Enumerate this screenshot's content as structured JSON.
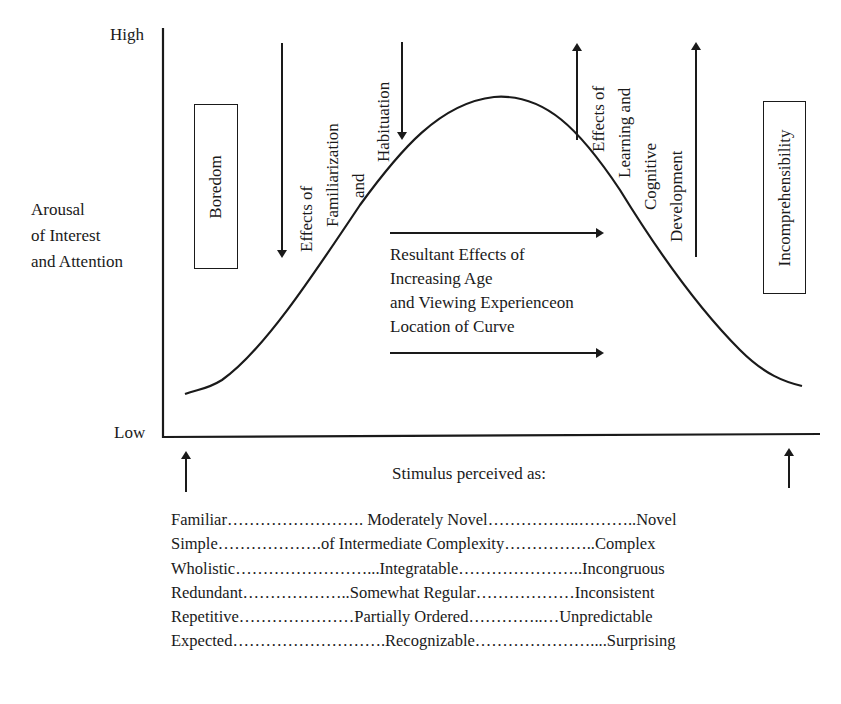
{
  "y_axis": {
    "high_label": "High",
    "low_label": "Low",
    "title_lines": [
      "Arousal",
      "of Interest",
      "and Attention"
    ]
  },
  "x_axis": {
    "title": "Stimulus perceived as:"
  },
  "boxes": {
    "left": "Boredom",
    "right": "Incomprehensibility"
  },
  "annotations": {
    "familiarization": [
      "Effects of",
      "Familiarization",
      "and",
      "Habituation"
    ],
    "learning": [
      "Effects of",
      "Learning and",
      "Cognitive",
      "Development"
    ],
    "resultant": [
      "Resultant Effects of",
      "Increasing Age",
      "and Viewing Experienceon",
      "Location of Curve"
    ]
  },
  "stimulus_rows": [
    {
      "text": "Familiar……………………. Moderately Novel……………..………..Novel"
    },
    {
      "text": "Simple……………….of Intermediate Complexity……………..Complex"
    },
    {
      "text": "Wholistic……………………...Integratable…………………..Incongruous"
    },
    {
      "text": "Redundant………………..Somewhat Regular………………Inconsistent"
    },
    {
      "text": "Repetitive…………………Partially Ordered…………..…Unpredictable"
    },
    {
      "text": "Expected……………………….Recognizable…………………....Surprising"
    }
  ],
  "colors": {
    "ink": "#1a1a1a",
    "background": "#ffffff"
  }
}
